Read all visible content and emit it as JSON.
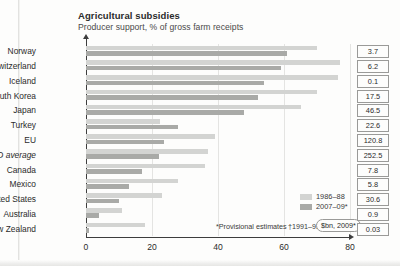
{
  "chart_data": {
    "type": "bar",
    "title": "Agricultural subsidies",
    "subtitle": "Producer support, % of gross farm receipts",
    "orientation": "horizontal",
    "xlabel": "",
    "ylabel": "",
    "xlim": [
      0,
      80
    ],
    "xticks": [
      "0",
      "20",
      "40",
      "60",
      "80"
    ],
    "grid": true,
    "legend_position": "bottom-right",
    "categories": [
      "Norway",
      "Switzerland",
      "Iceland",
      "South Korea",
      "Japan",
      "Turkey",
      "EU",
      "OECD average",
      "Canada",
      "Mexico",
      "United States",
      "Australia",
      "New Zealand"
    ],
    "series": [
      {
        "name": "1986–88",
        "color": "#d3d4d2",
        "values": [
          70.0,
          77.0,
          76.5,
          70.0,
          65.0,
          22.5,
          39.0,
          37.0,
          36.0,
          28.0,
          23.0,
          11.0,
          18.0
        ]
      },
      {
        "name": "2007–09*",
        "color": "#a9aaa7",
        "values": [
          61.0,
          59.0,
          54.0,
          52.0,
          48.0,
          28.0,
          23.5,
          22.0,
          17.0,
          13.0,
          10.0,
          4.0,
          1.0
        ]
      }
    ],
    "value_boxes": {
      "header": "$bn, 2009*",
      "values": [
        "3.7",
        "6.2",
        "0.1",
        "17.5",
        "46.5",
        "22.6",
        "120.8",
        "252.5",
        "7.8",
        "5.8",
        "30.6",
        "0.9",
        "0.03"
      ]
    },
    "annotations": [
      "*Provisional estimates",
      "†1991–93"
    ]
  },
  "footnotes": {
    "provisional": "*Provisional estimates",
    "range_1991": "†1991–93",
    "unit": "$bn, 2009*"
  }
}
